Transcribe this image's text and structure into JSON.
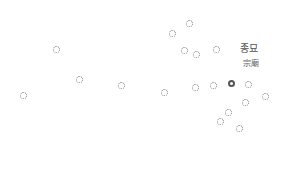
{
  "map": {
    "selected_station": {
      "name_ko": "종묘",
      "name_hanja": "宗廟",
      "x": 231,
      "y": 83,
      "label_ko_pos": [
        249,
        47
      ],
      "label_hanja_pos": [
        251,
        62
      ]
    },
    "stations": [
      {
        "x": 189,
        "y": 23
      },
      {
        "x": 172,
        "y": 33
      },
      {
        "x": 56,
        "y": 49
      },
      {
        "x": 184,
        "y": 50
      },
      {
        "x": 196,
        "y": 54
      },
      {
        "x": 216,
        "y": 49
      },
      {
        "x": 79,
        "y": 79
      },
      {
        "x": 121,
        "y": 85
      },
      {
        "x": 23,
        "y": 95
      },
      {
        "x": 164,
        "y": 92
      },
      {
        "x": 195,
        "y": 87
      },
      {
        "x": 213,
        "y": 85
      },
      {
        "x": 248,
        "y": 84
      },
      {
        "x": 265,
        "y": 96
      },
      {
        "x": 245,
        "y": 102
      },
      {
        "x": 228,
        "y": 112
      },
      {
        "x": 220,
        "y": 121
      },
      {
        "x": 239,
        "y": 128
      }
    ],
    "colors": {
      "background": "#ffffff",
      "station_ring": "#8a8a8a",
      "selected_ring": "#555555",
      "label": "#555555"
    }
  }
}
